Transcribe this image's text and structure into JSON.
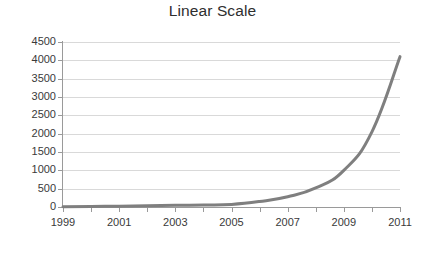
{
  "chart_data": {
    "type": "line",
    "title": "Linear Scale",
    "xlabel": "",
    "ylabel": "",
    "x": [
      1999,
      2000,
      2001,
      2002,
      2003,
      2004,
      2005,
      2006,
      2007,
      2008,
      2009,
      2010,
      2011
    ],
    "series": [
      {
        "name": "value",
        "color": "#7f7f7f",
        "values": [
          10,
          15,
          22,
          32,
          45,
          55,
          70,
          150,
          280,
          520,
          1000,
          2050,
          4100
        ]
      }
    ],
    "xlim": [
      1999,
      2011
    ],
    "ylim": [
      0,
      4500
    ],
    "xtick_labels": [
      "1999",
      "2001",
      "2003",
      "2005",
      "2007",
      "2009",
      "2011"
    ],
    "xtick_values": [
      1999,
      2001,
      2003,
      2005,
      2007,
      2009,
      2011
    ],
    "xtick_minor_values": [
      1999,
      2000,
      2001,
      2002,
      2003,
      2004,
      2005,
      2006,
      2007,
      2008,
      2009,
      2010,
      2011
    ],
    "ytick_labels": [
      "0",
      "500",
      "1000",
      "1500",
      "2000",
      "2500",
      "3000",
      "3500",
      "4000",
      "4500"
    ],
    "ytick_values": [
      0,
      500,
      1000,
      1500,
      2000,
      2500,
      3000,
      3500,
      4000,
      4500
    ],
    "grid": true,
    "grid_axis": "y",
    "legend": false,
    "legend_position": "none",
    "background_color": "#ffffff",
    "grid_color": "#d9d9d9",
    "axis_color": "#9a9a9a",
    "text_color": "#3a3a3a",
    "line_width": 3
  }
}
